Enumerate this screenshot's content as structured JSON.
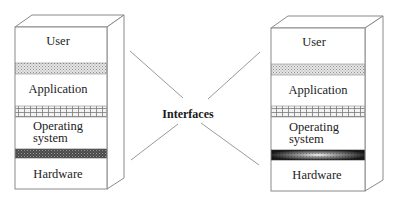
{
  "diagram": {
    "center_label": "Interfaces",
    "left_stack": {
      "layers": [
        {
          "label": "User"
        },
        {
          "label": "Application"
        },
        {
          "label": "Operating",
          "label2": "system"
        },
        {
          "label": "Hardware"
        }
      ],
      "bands": [
        {
          "pattern": "dotted",
          "between": [
            "User",
            "Application"
          ]
        },
        {
          "pattern": "grid",
          "between": [
            "Application",
            "Operating system"
          ]
        },
        {
          "pattern": "dark-crosshatch",
          "between": [
            "Operating system",
            "Hardware"
          ]
        }
      ]
    },
    "right_stack": {
      "layers": [
        {
          "label": "User"
        },
        {
          "label": "Application"
        },
        {
          "label": "Operating",
          "label2": "system"
        },
        {
          "label": "Hardware"
        }
      ],
      "bands": [
        {
          "pattern": "dotted",
          "between": [
            "User",
            "Application"
          ]
        },
        {
          "pattern": "grid",
          "between": [
            "Application",
            "Operating system"
          ]
        },
        {
          "pattern": "dark-radial-gradient",
          "between": [
            "Operating system",
            "Hardware"
          ]
        }
      ]
    },
    "colors": {
      "outline": "#8a8a8a",
      "dotted_band": "#cfcfcf",
      "grid_band": "#bdbdbd",
      "dark_band": "#3a3a3a",
      "text": "#222222"
    }
  }
}
